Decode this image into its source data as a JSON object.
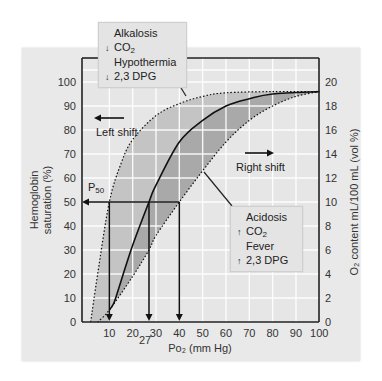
{
  "chart_data": {
    "type": "line",
    "title": "",
    "xlabel": "PO2 (mm Hg)",
    "ylabel": "Hemoglobin saturation (%)",
    "y2label": "O2 content mL/100 mL (vol %)",
    "xlim": [
      0,
      100
    ],
    "ylim": [
      0,
      100
    ],
    "y2lim": [
      0,
      20
    ],
    "x_ticks": [
      10,
      20,
      30,
      40,
      50,
      60,
      70,
      80,
      90,
      100
    ],
    "y_ticks": [
      0,
      10,
      20,
      30,
      40,
      50,
      60,
      70,
      80,
      90,
      100
    ],
    "y2_ticks": [
      0,
      2,
      4,
      6,
      8,
      10,
      12,
      14,
      16,
      18,
      20
    ],
    "grid": true,
    "series": [
      {
        "name": "Left shift (Alkalosis, ↓CO2, Hypothermia, ↓2,3 DPG)",
        "style": "dotted",
        "x": [
          2,
          5,
          10,
          15,
          20,
          30,
          40,
          50,
          60,
          80,
          100
        ],
        "y": [
          0,
          20,
          50,
          66,
          76,
          86,
          91,
          94,
          95.5,
          96,
          96
        ]
      },
      {
        "name": "Normal",
        "style": "solid",
        "x": [
          10,
          12,
          15,
          20,
          27,
          30,
          40,
          50,
          60,
          70,
          80,
          100
        ],
        "y": [
          5,
          8,
          17,
          32,
          50,
          57,
          75,
          84,
          90,
          93,
          95,
          96
        ]
      },
      {
        "name": "Right shift (Acidosis, ↑CO2, Fever, ↑2,3 DPG)",
        "style": "dotted",
        "x": [
          5,
          10,
          20,
          27,
          30,
          40,
          50,
          60,
          70,
          80,
          90,
          100
        ],
        "y": [
          0,
          5,
          19,
          30,
          36,
          50,
          63,
          75,
          84,
          90,
          94,
          96
        ]
      }
    ],
    "annotations": [
      {
        "text": "P50",
        "x": 0,
        "y": 50
      },
      {
        "text": "27",
        "x": 27,
        "y": 0,
        "note": "P50 of normal curve"
      },
      {
        "text": "Left shift",
        "arrow": "left"
      },
      {
        "text": "Right shift",
        "arrow": "right"
      },
      {
        "text": "P50 drop lines at PO2 = 10, 27, 40"
      }
    ]
  },
  "labels": {
    "y_axis_title_line1": "Hemoglobin",
    "y_axis_title_line2": "saturation (%)",
    "y2_axis_title": "O₂ content mL/100 mL (vol %)",
    "x_axis_title": "Po₂ (mm Hg)",
    "x_extra_tick": "27",
    "p50": "P",
    "p50_sub": "50",
    "left_shift": "Left shift",
    "right_shift": "Right shift"
  },
  "callout_left": {
    "line1": "Alkalosis",
    "arrow2": "↓",
    "line2": "CO",
    "line2_sub": "2",
    "line3": "Hypothermia",
    "arrow4": "↓",
    "line4": "2,3 DPG"
  },
  "callout_right": {
    "line1": "Acidosis",
    "arrow2": "↑",
    "line2": "CO",
    "line2_sub": "2",
    "line3": "Fever",
    "arrow4": "↑",
    "line4": "2,3 DPG"
  },
  "colors": {
    "panel_bg": "#e9e9e9",
    "plot_bg": "#e6e6e6",
    "grid": "#ffffff",
    "left_band": "#c4c4c4",
    "right_band": "#a9a9a9",
    "line": "#111111"
  }
}
